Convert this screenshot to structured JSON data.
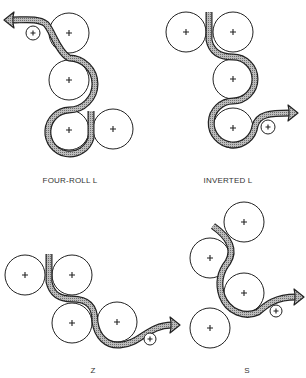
{
  "web_color": "#9a9a9a",
  "outline_color": "#222222",
  "panels": [
    {
      "id": "four-roll-l",
      "label": "FOUR-ROLL L",
      "label_pos": [
        70,
        176
      ],
      "rolls": [
        {
          "cx": 69,
          "cy": 33,
          "r": 20
        },
        {
          "cx": 69,
          "cy": 80,
          "r": 20
        },
        {
          "cx": 69,
          "cy": 130,
          "r": 20
        },
        {
          "cx": 113,
          "cy": 129,
          "r": 20
        }
      ],
      "idler": {
        "cx": 33,
        "cy": 33,
        "r": 7
      },
      "web_path": "M91 111 L91 138 A22 22 0 1 1 69 110 A22 22 0 0 0 69 58 C58 52 52 30 46 24 C38 18 25 20 12 20",
      "arrow": {
        "x": 4,
        "y": 20,
        "dir": "left"
      }
    },
    {
      "id": "inverted-l",
      "label": "INVERTED L",
      "label_pos": [
        228,
        176
      ],
      "rolls": [
        {
          "cx": 186,
          "cy": 32,
          "r": 20
        },
        {
          "cx": 233,
          "cy": 32,
          "r": 20
        },
        {
          "cx": 233,
          "cy": 79,
          "r": 20
        },
        {
          "cx": 233,
          "cy": 128,
          "r": 20
        }
      ],
      "idler": {
        "cx": 268,
        "cy": 127,
        "r": 7
      },
      "web_path": "M209 12 L209 40 C212 55 225 57 233 57 A22 22 0 0 1 233 101 A22 22 0 1 0 255 126 C258 114 270 113 290 113",
      "arrow": {
        "x": 298,
        "y": 113,
        "dir": "right"
      }
    },
    {
      "id": "z",
      "label": "Z",
      "label_pos": [
        93,
        366
      ],
      "rolls": [
        {
          "cx": 25,
          "cy": 275,
          "r": 20
        },
        {
          "cx": 72,
          "cy": 275,
          "r": 20
        },
        {
          "cx": 72,
          "cy": 323,
          "r": 20
        },
        {
          "cx": 117,
          "cy": 322,
          "r": 20
        }
      ],
      "idler": {
        "cx": 150,
        "cy": 339,
        "r": 6
      },
      "web_path": "M49 254 L49 282 C52 295 60 299 72 299 C88 299 95 306 95 322 C97 336 106 346 120 345 C140 344 148 325 172 325",
      "arrow": {
        "x": 180,
        "y": 325,
        "dir": "right"
      }
    },
    {
      "id": "s",
      "label": "S",
      "label_pos": [
        247,
        366
      ],
      "rolls": [
        {
          "cx": 244,
          "cy": 222,
          "r": 20
        },
        {
          "cx": 210,
          "cy": 258,
          "r": 20
        },
        {
          "cx": 244,
          "cy": 293,
          "r": 20
        },
        {
          "cx": 210,
          "cy": 328,
          "r": 20
        }
      ],
      "idler": {
        "cx": 276,
        "cy": 311,
        "r": 6
      },
      "web_path": "M213 226 C230 238 235 250 228 262 C220 272 218 284 222 296 C228 312 245 318 258 312 C266 305 275 297 296 297",
      "arrow": {
        "x": 304,
        "y": 297,
        "dir": "right"
      }
    }
  ]
}
